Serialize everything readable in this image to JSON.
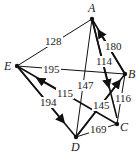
{
  "graph": {
    "nodes": [
      {
        "id": "A",
        "label": "A",
        "x": 92,
        "y": 19
      },
      {
        "id": "B",
        "label": "B",
        "x": 125,
        "y": 81
      },
      {
        "id": "C",
        "label": "C",
        "x": 117,
        "y": 124
      },
      {
        "id": "D",
        "label": "D",
        "x": 76,
        "y": 138
      },
      {
        "id": "E",
        "label": "E",
        "x": 17,
        "y": 75
      }
    ],
    "edges": [
      {
        "from": "E",
        "to": "A",
        "weight": "128"
      },
      {
        "from": "B",
        "to": "A",
        "weight": "180",
        "directed": true
      },
      {
        "from": "A",
        "to": "C",
        "weight": "114",
        "directed": true
      },
      {
        "from": "A",
        "to": "D",
        "weight": "147"
      },
      {
        "from": "E",
        "to": "B",
        "weight": "195"
      },
      {
        "from": "C",
        "to": "E",
        "weight": "115",
        "directed": true
      },
      {
        "from": "E",
        "to": "D",
        "weight": "194",
        "directed": true
      },
      {
        "from": "D",
        "to": "B",
        "weight": "145",
        "directed": true
      },
      {
        "from": "B",
        "to": "C",
        "weight": "116"
      },
      {
        "from": "D",
        "to": "C",
        "weight": "169"
      }
    ]
  }
}
